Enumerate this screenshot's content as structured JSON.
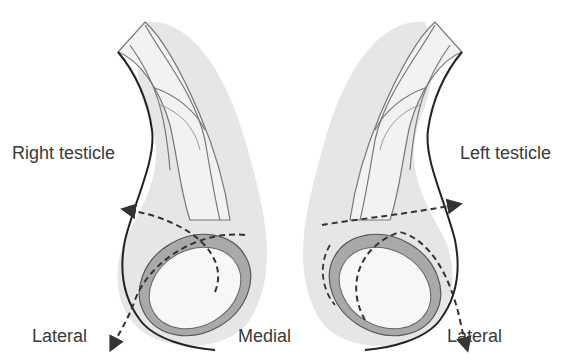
{
  "diagram": {
    "type": "anatomical-illustration",
    "labels": {
      "right_testicle": "Right testicle",
      "left_testicle": "Left testicle",
      "lateral_left": "Lateral",
      "medial": "Medial",
      "lateral_right": "Lateral"
    },
    "colors": {
      "scrotum_fill": "#e6e6e6",
      "cord_fill": "#f2f2f2",
      "tunica_fill": "#a9a9a9",
      "testis_fill": "#f7f7f7",
      "outline": "#222222",
      "dashed_arrow": "#333333",
      "text": "#3a3a3a"
    },
    "arrows": [
      {
        "side": "right",
        "style": "dashed",
        "direction": "from lateral-bottom, sweeps toward upper-left"
      },
      {
        "side": "left",
        "style": "dashed",
        "direction": "from upper-right, sweeps toward lateral-bottom"
      }
    ]
  }
}
